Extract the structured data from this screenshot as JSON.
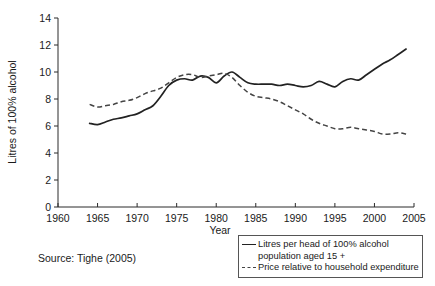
{
  "chart_data": {
    "type": "line",
    "title": "",
    "xlabel": "Year",
    "ylabel": "Litres of 100% alcohol",
    "xlim": [
      1960,
      2005
    ],
    "ylim": [
      0,
      14
    ],
    "xticks": [
      1960,
      1965,
      1970,
      1975,
      1980,
      1985,
      1990,
      1995,
      2000,
      2005
    ],
    "yticks": [
      0,
      2,
      4,
      6,
      8,
      10,
      12,
      14
    ],
    "grid": false,
    "legend_position": "below-right",
    "source_note": "Source: Tighe (2005)",
    "x": [
      1964,
      1965,
      1966,
      1967,
      1968,
      1969,
      1970,
      1971,
      1972,
      1973,
      1974,
      1975,
      1976,
      1977,
      1978,
      1979,
      1980,
      1981,
      1982,
      1983,
      1984,
      1985,
      1986,
      1987,
      1988,
      1989,
      1990,
      1991,
      1992,
      1993,
      1994,
      1995,
      1996,
      1997,
      1998,
      1999,
      2000,
      2001,
      2002,
      2003,
      2004
    ],
    "series": [
      {
        "name": "Litres per head of 100% alcohol population aged 15 +",
        "style": "solid",
        "color": "#222222",
        "values": [
          6.2,
          6.1,
          6.3,
          6.5,
          6.6,
          6.75,
          6.9,
          7.2,
          7.5,
          8.2,
          9.0,
          9.4,
          9.5,
          9.4,
          9.7,
          9.6,
          9.2,
          9.7,
          10.0,
          9.6,
          9.2,
          9.1,
          9.1,
          9.1,
          9.0,
          9.1,
          9.0,
          8.9,
          9.0,
          9.3,
          9.1,
          8.9,
          9.3,
          9.5,
          9.4,
          9.8,
          10.2,
          10.6,
          10.9,
          11.3,
          11.7
        ]
      },
      {
        "name": "Price relative to household expenditure",
        "style": "dashed",
        "color": "#444444",
        "values": [
          7.6,
          7.4,
          7.5,
          7.6,
          7.8,
          7.9,
          8.1,
          8.4,
          8.6,
          8.8,
          9.2,
          9.6,
          9.8,
          9.8,
          9.6,
          9.7,
          9.8,
          9.9,
          9.6,
          9.0,
          8.5,
          8.2,
          8.1,
          8.0,
          7.8,
          7.5,
          7.2,
          6.9,
          6.5,
          6.2,
          6.0,
          5.8,
          5.8,
          5.9,
          5.8,
          5.7,
          5.6,
          5.4,
          5.4,
          5.5,
          5.4
        ]
      }
    ]
  },
  "legend": {
    "entries": [
      {
        "line1": "Litres per head of 100% alcohol",
        "line2": "population aged 15 +",
        "sample": "solid-line-sample"
      },
      {
        "line1": "Price relative to household expenditure",
        "line2": "",
        "sample": "dashed-line-sample"
      }
    ]
  },
  "source": {
    "text": "Source: Tighe (2005)"
  }
}
